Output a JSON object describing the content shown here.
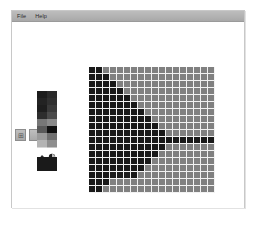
{
  "window": {
    "title": ""
  },
  "menu": {
    "items": [
      {
        "label": "File",
        "name": "menu-file"
      },
      {
        "label": "Help",
        "name": "menu-help"
      }
    ]
  },
  "toolbar": {
    "mode_buttons": [
      {
        "name": "grid-view-button",
        "glyph": "⊞",
        "label": ""
      },
      {
        "name": "blank-view-button",
        "glyph": "",
        "label": ""
      }
    ],
    "tool_icons": [
      {
        "name": "brush-icon",
        "label": ""
      },
      {
        "name": "eraser-icon",
        "label": ""
      }
    ],
    "current_color_label": "",
    "current_color": "#1a1a1a"
  },
  "palette": {
    "label": "",
    "colors": [
      "#1c1c1c",
      "#2a2a2a",
      "#232323",
      "#303030",
      "#1e1e1e",
      "#3a3a3a",
      "#2d2d2d",
      "#4a4a4a",
      "#777777",
      "#8a8a8a",
      "#5a5a5a",
      "#111111",
      "#9a9a9a",
      "#707070",
      "#b4b4b4",
      "#8e8e8e",
      "#d8d8d8",
      "#c4c4c4"
    ]
  },
  "canvas": {
    "label": "",
    "columns": 18,
    "rows": 18,
    "cell_size": 7,
    "background_color": "#808080",
    "foreground_color": "#1a1a1a",
    "gridline_color": "#f2f2f2",
    "pattern": [
      "11................",
      "111...............",
      "1111..............",
      "11111.............",
      "111111............",
      "1111111...........",
      "11111111..........",
      "111111111.........",
      "1111111111........",
      "11111111111.......",
      "111111111111111111",
      "11111111111.......",
      "1111111111........",
      "111111111.........",
      "11111111..........",
      "1111111...........",
      "111...............",
      "11................"
    ]
  },
  "chart_data": {
    "type": "heatmap",
    "title": "",
    "xlabel": "",
    "ylabel": "",
    "grid": true,
    "columns": 18,
    "rows": 18,
    "legend": [
      {
        "name": "filled",
        "color": "#1a1a1a"
      },
      {
        "name": "empty",
        "color": "#808080"
      }
    ],
    "values": [
      [
        1,
        1,
        0,
        0,
        0,
        0,
        0,
        0,
        0,
        0,
        0,
        0,
        0,
        0,
        0,
        0,
        0,
        0
      ],
      [
        1,
        1,
        1,
        0,
        0,
        0,
        0,
        0,
        0,
        0,
        0,
        0,
        0,
        0,
        0,
        0,
        0,
        0
      ],
      [
        1,
        1,
        1,
        1,
        0,
        0,
        0,
        0,
        0,
        0,
        0,
        0,
        0,
        0,
        0,
        0,
        0,
        0
      ],
      [
        1,
        1,
        1,
        1,
        1,
        0,
        0,
        0,
        0,
        0,
        0,
        0,
        0,
        0,
        0,
        0,
        0,
        0
      ],
      [
        1,
        1,
        1,
        1,
        1,
        1,
        0,
        0,
        0,
        0,
        0,
        0,
        0,
        0,
        0,
        0,
        0,
        0
      ],
      [
        1,
        1,
        1,
        1,
        1,
        1,
        1,
        0,
        0,
        0,
        0,
        0,
        0,
        0,
        0,
        0,
        0,
        0
      ],
      [
        1,
        1,
        1,
        1,
        1,
        1,
        1,
        1,
        0,
        0,
        0,
        0,
        0,
        0,
        0,
        0,
        0,
        0
      ],
      [
        1,
        1,
        1,
        1,
        1,
        1,
        1,
        1,
        1,
        0,
        0,
        0,
        0,
        0,
        0,
        0,
        0,
        0
      ],
      [
        1,
        1,
        1,
        1,
        1,
        1,
        1,
        1,
        1,
        1,
        0,
        0,
        0,
        0,
        0,
        0,
        0,
        0
      ],
      [
        1,
        1,
        1,
        1,
        1,
        1,
        1,
        1,
        1,
        1,
        1,
        0,
        0,
        0,
        0,
        0,
        0,
        0
      ],
      [
        1,
        1,
        1,
        1,
        1,
        1,
        1,
        1,
        1,
        1,
        1,
        1,
        1,
        1,
        1,
        1,
        1,
        1
      ],
      [
        1,
        1,
        1,
        1,
        1,
        1,
        1,
        1,
        1,
        1,
        1,
        0,
        0,
        0,
        0,
        0,
        0,
        0
      ],
      [
        1,
        1,
        1,
        1,
        1,
        1,
        1,
        1,
        1,
        1,
        0,
        0,
        0,
        0,
        0,
        0,
        0,
        0
      ],
      [
        1,
        1,
        1,
        1,
        1,
        1,
        1,
        1,
        1,
        0,
        0,
        0,
        0,
        0,
        0,
        0,
        0,
        0
      ],
      [
        1,
        1,
        1,
        1,
        1,
        1,
        1,
        1,
        0,
        0,
        0,
        0,
        0,
        0,
        0,
        0,
        0,
        0
      ],
      [
        1,
        1,
        1,
        1,
        1,
        1,
        1,
        0,
        0,
        0,
        0,
        0,
        0,
        0,
        0,
        0,
        0,
        0
      ],
      [
        1,
        1,
        1,
        0,
        0,
        0,
        0,
        0,
        0,
        0,
        0,
        0,
        0,
        0,
        0,
        0,
        0,
        0
      ],
      [
        1,
        1,
        0,
        0,
        0,
        0,
        0,
        0,
        0,
        0,
        0,
        0,
        0,
        0,
        0,
        0,
        0,
        0
      ]
    ]
  }
}
